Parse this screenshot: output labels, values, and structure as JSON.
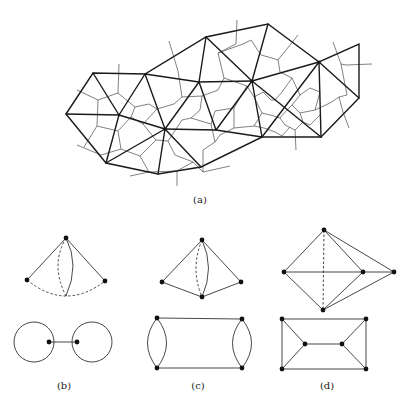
{
  "figure": {
    "panels": [
      {
        "id": "a",
        "label": "(a)",
        "caption": "Triangulation with dual Voronoi-like cell network"
      },
      {
        "id": "b",
        "label": "(b)",
        "caption": "Dual graph pair: triangle with curved edges / two loops joined by bridge"
      },
      {
        "id": "c",
        "label": "(c)",
        "caption": "Dual graph pair: two triangles with double edge / cycle with double edges"
      },
      {
        "id": "d",
        "label": "(d)",
        "caption": "Dual graph pair: octahedral shape / prism graph"
      }
    ]
  },
  "colors": {
    "edge": "#1a1a1a",
    "dual_edge": "#4a4a4a",
    "background": "#ffffff"
  }
}
